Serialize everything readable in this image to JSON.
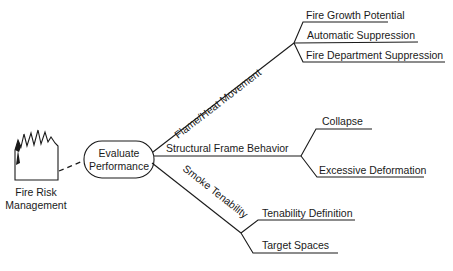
{
  "diagram": {
    "root": {
      "label_line1": "Fire Risk",
      "label_line2": "Management",
      "icon": "building-on-fire-icon"
    },
    "hub": {
      "label_line1": "Evaluate",
      "label_line2": "Performance"
    },
    "branches": [
      {
        "label": "Flame/Heat Movement",
        "children": [
          "Fire Growth Potential",
          "Automatic Suppression",
          "Fire Department Suppression"
        ]
      },
      {
        "label": "Structural Frame Behavior",
        "children": [
          "Collapse",
          "Excessive Deformation"
        ]
      },
      {
        "label": "Smoke Tenability",
        "children": [
          "Tenability Definition",
          "Target Spaces"
        ]
      }
    ],
    "colors": {
      "ink": "#1a1a1a",
      "background": "#ffffff"
    }
  }
}
